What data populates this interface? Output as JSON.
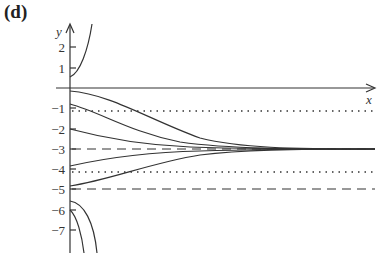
{
  "panel": {
    "label": "(d)"
  },
  "axes": {
    "x_label": "x",
    "y_label": "y",
    "y_ticks": [
      {
        "value": 2,
        "label": "2"
      },
      {
        "value": 1,
        "label": "1"
      },
      {
        "value": -1,
        "label": "−1"
      },
      {
        "value": -2,
        "label": "−2"
      },
      {
        "value": -3,
        "label": "−3"
      },
      {
        "value": -4,
        "label": "−4"
      },
      {
        "value": -5,
        "label": "−5"
      },
      {
        "value": -6,
        "label": "−6"
      },
      {
        "value": -7,
        "label": "−7"
      }
    ]
  },
  "reference_lines": [
    {
      "y": -1.1,
      "style": "dotted"
    },
    {
      "y": -3,
      "style": "dashed"
    },
    {
      "y": -4.1,
      "style": "dotted"
    },
    {
      "y": -5,
      "style": "dashed"
    }
  ],
  "solution_curves": {
    "converging_to": -3,
    "initial_values": [
      -0.15,
      -0.8,
      -2,
      -3.8,
      -4.8
    ],
    "upper_blowup_initial": 0.55,
    "lower_blowdown_initials": [
      -5.6,
      -6
    ]
  },
  "colors": {
    "ink": "#333333",
    "background": "#ffffff"
  }
}
